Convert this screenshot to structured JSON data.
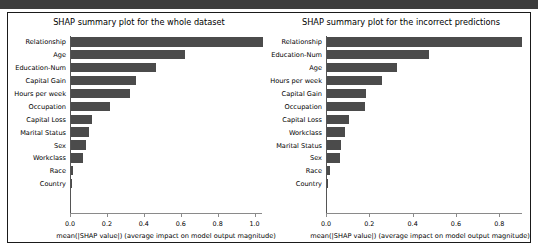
{
  "figure": {
    "panels": [
      {
        "id": "whole-dataset",
        "title": "SHAP summary plot for the whole dataset",
        "xlabel": "mean(|SHAP value|) (average impact on model output magnitude)",
        "tick_labels": [
          "0.0",
          "0.2",
          "0.4",
          "0.6",
          "0.8",
          "1.0"
        ]
      },
      {
        "id": "incorrect-predictions",
        "title": "SHAP summary plot for the incorrect predictions",
        "xlabel": "mean(|SHAP value|) (average impact on model output magnitude)",
        "tick_labels": [
          "0.0",
          "0.2",
          "0.4",
          "0.6",
          "0.8"
        ]
      }
    ]
  },
  "chart_data": [
    {
      "type": "bar",
      "orientation": "horizontal",
      "title": "SHAP summary plot for the whole dataset",
      "xlabel": "mean(|SHAP value|) (average impact on model output magnitude)",
      "ylabel": "",
      "xlim": [
        0.0,
        1.04
      ],
      "xticks": [
        0.0,
        0.2,
        0.4,
        0.6,
        0.8,
        1.0
      ],
      "grid": false,
      "legend": null,
      "bar_color": "#4b4b4b",
      "categories": [
        "Relationship",
        "Age",
        "Education-Num",
        "Capital Gain",
        "Hours per week",
        "Occupation",
        "Capital Loss",
        "Marital Status",
        "Sex",
        "Workclass",
        "Race",
        "Country"
      ],
      "values": [
        1.04,
        0.62,
        0.46,
        0.35,
        0.32,
        0.21,
        0.115,
        0.1,
        0.082,
        0.065,
        0.012,
        0.006
      ]
    },
    {
      "type": "bar",
      "orientation": "horizontal",
      "title": "SHAP summary plot for the incorrect predictions",
      "xlabel": "mean(|SHAP value|) (average impact on model output magnitude)",
      "ylabel": "",
      "xlim": [
        0.0,
        0.905
      ],
      "xticks": [
        0.0,
        0.2,
        0.4,
        0.6,
        0.8
      ],
      "grid": false,
      "legend": null,
      "bar_color": "#4b4b4b",
      "categories": [
        "Relationship",
        "Education-Num",
        "Age",
        "Hours per week",
        "Capital Gain",
        "Occupation",
        "Capital Loss",
        "Workclass",
        "Marital Status",
        "Sex",
        "Race",
        "Country"
      ],
      "values": [
        0.9,
        0.47,
        0.325,
        0.255,
        0.18,
        0.175,
        0.1,
        0.085,
        0.065,
        0.06,
        0.014,
        0.006
      ]
    }
  ]
}
